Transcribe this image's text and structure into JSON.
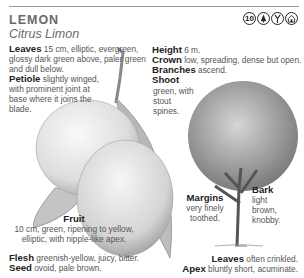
{
  "header": {
    "common_name": "LEMON",
    "scientific_name": "Citrus Limon",
    "icons": [
      {
        "name": "height-10-icon",
        "glyph": "10"
      },
      {
        "name": "evergreen-tree-icon",
        "glyph": "tree"
      },
      {
        "name": "branch-leaf-icon",
        "glyph": "branch"
      },
      {
        "name": "habitat-icon",
        "glyph": "house"
      }
    ]
  },
  "leaves": {
    "label": "Leaves",
    "text": " 15 cm, elliptic, evergreen, glossy dark green above, paler green and dull below."
  },
  "petiole": {
    "label": "Petiole",
    "text": " slightly winged, with prominent joint at base where it joins the blade."
  },
  "height": {
    "label": "Height",
    "text": " 6 m."
  },
  "crown": {
    "label": "Crown",
    "text": " low, spreading, dense but open."
  },
  "branches": {
    "label": "Branches",
    "text": " ascend."
  },
  "shoot": {
    "label": "Shoot",
    "text": "green, with stout spines."
  },
  "fruit": {
    "label": "Fruit",
    "text": "10 cm, green, ripening to yellow, elliptic, with nipple-like apex."
  },
  "flesh": {
    "label": "Flesh",
    "text": " greenish-yellow, juicy, bitter."
  },
  "seed": {
    "label": "Seed",
    "text": " ovoid, pale brown."
  },
  "margins": {
    "label": "Margins",
    "text": "very finely toothed."
  },
  "bark": {
    "label": "Bark",
    "text": "light brown, knobby."
  },
  "leaves_note": {
    "label": "Leaves",
    "text": " often crinkled."
  },
  "apex": {
    "label": "Apex",
    "text": " bluntly short, acuminate."
  }
}
